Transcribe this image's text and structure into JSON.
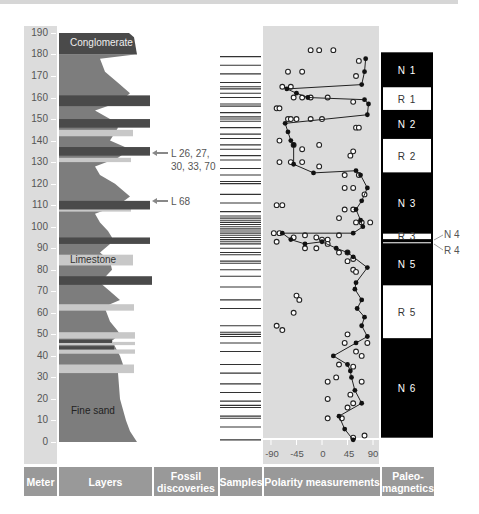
{
  "footer": {
    "meter": "Meter",
    "layers": "Layers",
    "fossil": "Fossil discoveries",
    "samples": "Samples",
    "polarity": "Polarity measurements",
    "paleo": "Paleo-magnetics"
  },
  "meter_ticks": [
    "0",
    "10",
    "20",
    "30",
    "40",
    "50",
    "60",
    "70",
    "80",
    "90",
    "100",
    "110",
    "120",
    "130",
    "140",
    "150",
    "160",
    "170",
    "180",
    "190"
  ],
  "layer_labels": {
    "conglomerate": "Conglomerate",
    "limestone": "Limestone",
    "fine_sand": "Fine sand"
  },
  "fossils": {
    "upper": "L 26, 27,",
    "upper2": "30, 33, 70",
    "lower": "L 68"
  },
  "polarity_axis": [
    "-90",
    "-45",
    "0",
    "45",
    "90"
  ],
  "paleomagnetics": {
    "zones": [
      {
        "name": "N 1",
        "top": 181,
        "bottom": 165,
        "type": "normal"
      },
      {
        "name": "R 1",
        "top": 165,
        "bottom": 154,
        "type": "reversed"
      },
      {
        "name": "N 2",
        "top": 154,
        "bottom": 141,
        "type": "normal"
      },
      {
        "name": "R 2",
        "top": 141,
        "bottom": 125,
        "type": "reversed"
      },
      {
        "name": "N 3",
        "top": 125,
        "bottom": 97,
        "type": "normal"
      },
      {
        "name": "R 3",
        "top": 97,
        "bottom": 94,
        "type": "reversed"
      },
      {
        "name": "N 4",
        "top": 94,
        "bottom": 93,
        "type": "normal"
      },
      {
        "name": "R 4",
        "top": 93,
        "bottom": 92.5,
        "type": "reversed"
      },
      {
        "name": "N 5",
        "top": 92.5,
        "bottom": 73,
        "type": "normal"
      },
      {
        "name": "R 5",
        "top": 73,
        "bottom": 48,
        "type": "reversed"
      },
      {
        "name": "N 6",
        "top": 48,
        "bottom": 2,
        "type": "normal"
      }
    ],
    "side_labels": [
      "N 4",
      "R 4"
    ]
  },
  "chart_data": {
    "type": "scatter",
    "ylabel": "Meter",
    "xlabel": "Polarity measurements",
    "ylim": [
      0,
      190
    ],
    "xlim": [
      -90,
      90
    ],
    "x_ticks": [
      -90,
      -45,
      0,
      45,
      90
    ],
    "y_ticks": [
      0,
      10,
      20,
      30,
      40,
      50,
      60,
      70,
      80,
      90,
      100,
      110,
      120,
      130,
      140,
      150,
      160,
      170,
      180,
      190
    ],
    "series": [
      {
        "name": "mean polarity (line)",
        "points": [
          [
            55,
            1
          ],
          [
            40,
            6
          ],
          [
            30,
            12
          ],
          [
            70,
            18
          ],
          [
            58,
            24
          ],
          [
            52,
            30
          ],
          [
            50,
            33
          ],
          [
            45,
            36
          ],
          [
            20,
            40
          ],
          [
            60,
            46
          ],
          [
            80,
            49
          ],
          [
            70,
            54
          ],
          [
            75,
            58
          ],
          [
            62,
            62
          ],
          [
            70,
            66
          ],
          [
            58,
            71
          ],
          [
            60,
            74
          ],
          [
            80,
            81
          ],
          [
            55,
            86
          ],
          [
            45,
            88
          ],
          [
            25,
            90
          ],
          [
            0,
            93
          ],
          [
            -30,
            92
          ],
          [
            -55,
            94
          ],
          [
            -70,
            97
          ],
          [
            55,
            97
          ],
          [
            72,
            100
          ],
          [
            68,
            103
          ],
          [
            60,
            108
          ],
          [
            70,
            112
          ],
          [
            80,
            118
          ],
          [
            68,
            124
          ],
          [
            60,
            126
          ],
          [
            -15,
            125
          ],
          [
            -50,
            129
          ],
          [
            -50,
            138
          ],
          [
            -55,
            140
          ],
          [
            -60,
            144
          ],
          [
            -65,
            148
          ],
          [
            80,
            152
          ],
          [
            82,
            157
          ],
          [
            75,
            159
          ],
          [
            -25,
            160
          ],
          [
            -45,
            162
          ],
          [
            -62,
            164
          ],
          [
            70,
            166
          ],
          [
            75,
            172
          ],
          [
            77,
            178
          ]
        ]
      },
      {
        "name": "individual measurements (open circles)",
        "points": [
          [
            -5,
            182
          ],
          [
            -20,
            182
          ],
          [
            20,
            182
          ],
          [
            65,
            177
          ],
          [
            -60,
            172
          ],
          [
            -35,
            172
          ],
          [
            60,
            170
          ],
          [
            -70,
            165
          ],
          [
            -55,
            165
          ],
          [
            -50,
            160
          ],
          [
            -35,
            160
          ],
          [
            -20,
            160
          ],
          [
            10,
            160
          ],
          [
            55,
            158
          ],
          [
            -80,
            155
          ],
          [
            -75,
            155
          ],
          [
            -60,
            150
          ],
          [
            -55,
            150
          ],
          [
            -45,
            150
          ],
          [
            -20,
            150
          ],
          [
            0,
            150
          ],
          [
            60,
            146
          ],
          [
            65,
            146
          ],
          [
            -75,
            140
          ],
          [
            -50,
            138
          ],
          [
            -5,
            138
          ],
          [
            -35,
            136
          ],
          [
            55,
            135
          ],
          [
            50,
            133
          ],
          [
            -75,
            130
          ],
          [
            -55,
            130
          ],
          [
            -35,
            130
          ],
          [
            -5,
            128
          ],
          [
            40,
            124
          ],
          [
            65,
            124
          ],
          [
            55,
            118
          ],
          [
            40,
            118
          ],
          [
            75,
            115
          ],
          [
            -80,
            110
          ],
          [
            -70,
            110
          ],
          [
            55,
            108
          ],
          [
            40,
            108
          ],
          [
            30,
            104
          ],
          [
            60,
            102
          ],
          [
            70,
            102
          ],
          [
            85,
            102
          ],
          [
            -85,
            97
          ],
          [
            -75,
            97
          ],
          [
            -80,
            93
          ],
          [
            -50,
            95
          ],
          [
            -30,
            96
          ],
          [
            -10,
            95
          ],
          [
            0,
            94
          ],
          [
            10,
            94
          ],
          [
            30,
            96
          ],
          [
            10,
            92
          ],
          [
            -10,
            90
          ],
          [
            -30,
            90
          ],
          [
            30,
            88
          ],
          [
            45,
            88
          ],
          [
            55,
            85
          ],
          [
            45,
            84
          ],
          [
            55,
            80
          ],
          [
            60,
            79
          ],
          [
            -45,
            68
          ],
          [
            -40,
            66
          ],
          [
            -50,
            60
          ],
          [
            -80,
            54
          ],
          [
            -70,
            52
          ],
          [
            45,
            50
          ],
          [
            40,
            46
          ],
          [
            80,
            46
          ],
          [
            60,
            42
          ],
          [
            70,
            40
          ],
          [
            30,
            36
          ],
          [
            55,
            35
          ],
          [
            25,
            30
          ],
          [
            10,
            28
          ],
          [
            70,
            28
          ],
          [
            10,
            20
          ],
          [
            50,
            22
          ],
          [
            55,
            18
          ],
          [
            45,
            16
          ],
          [
            10,
            11
          ],
          [
            35,
            11
          ],
          [
            55,
            2
          ],
          [
            75,
            3
          ]
        ]
      }
    ],
    "samples_depths_m": [
      179,
      175,
      171,
      167,
      165,
      164,
      162,
      160,
      157,
      156,
      153,
      151,
      150,
      149,
      146,
      143,
      141,
      138,
      136,
      133,
      131,
      127,
      124,
      121,
      120,
      115,
      111,
      107,
      105,
      104,
      103,
      102,
      101,
      100,
      99,
      98,
      97,
      96,
      95,
      94,
      93,
      92,
      90,
      88,
      87,
      84,
      83,
      80,
      77,
      72,
      66,
      62,
      54,
      51,
      50,
      49,
      46,
      42,
      36,
      32,
      27,
      23,
      19,
      17,
      16,
      12,
      11,
      7,
      1
    ],
    "layer_column": {
      "conglomerate": [
        180,
        190
      ],
      "fine_sand": [
        0,
        32
      ],
      "limestone": [
        82,
        86
      ],
      "dark_bands_m": [
        158,
        148,
        135,
        110,
        94,
        75,
        47,
        44
      ],
      "light_bands_m": [
        143,
        131,
        108,
        86,
        63,
        49,
        45,
        42,
        34
      ]
    },
    "fossils": [
      {
        "label": "L 26, 27, 30, 33, 70",
        "depth_m": 159
      },
      {
        "label": "L 68",
        "depth_m": 110
      }
    ]
  }
}
